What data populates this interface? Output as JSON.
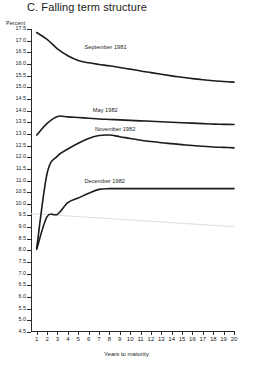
{
  "title": "C.  Falling term structure",
  "axis_unit_label": "Percent",
  "xlabel": "Years to maturity",
  "chart_data": {
    "type": "line",
    "title": "C.  Falling term structure",
    "xlabel": "Years to maturity",
    "ylabel": "Percent",
    "ylim": [
      4.5,
      17.5
    ],
    "xlim": [
      0.45,
      20
    ],
    "grid": false,
    "legend": "inline-annotations",
    "yticks": [
      "17.5",
      "17.0",
      "16.5",
      "16.0",
      "15.5",
      "15.0",
      "14.5",
      "14.0",
      "13.5",
      "13.0",
      "12.5",
      "12.0",
      "11.5",
      "11.0",
      "10.5",
      "10.0",
      "9.5",
      "9.0",
      "8.5",
      "8.0",
      "7.5",
      "7.0",
      "6.5",
      "6.0",
      "5.5",
      "5.0",
      "4.5"
    ],
    "ytick_values": [
      17.5,
      17.0,
      16.5,
      16.0,
      15.5,
      15.0,
      14.5,
      14.0,
      13.5,
      13.0,
      12.5,
      12.0,
      11.5,
      11.0,
      10.5,
      10.0,
      9.5,
      9.0,
      8.5,
      8.0,
      7.5,
      7.0,
      6.5,
      6.0,
      5.5,
      5.0,
      4.5
    ],
    "xticks": [
      "1",
      "2",
      "3",
      "4",
      "5",
      "6",
      "7",
      "8",
      "9",
      "10",
      "11",
      "12",
      "13",
      "14",
      "15",
      "16",
      "17",
      "18",
      "19",
      "20"
    ],
    "xtick_values": [
      1,
      2,
      3,
      4,
      5,
      6,
      7,
      8,
      9,
      10,
      11,
      12,
      13,
      14,
      15,
      16,
      17,
      18,
      19,
      20
    ],
    "x": [
      1,
      2,
      3,
      4,
      5,
      6,
      7,
      8,
      9,
      10,
      11,
      12,
      13,
      14,
      15,
      16,
      17,
      18,
      19,
      20
    ],
    "series": [
      {
        "name": "September 1981",
        "label": "September 1981",
        "color": "#1c1c1c",
        "values": [
          17.35,
          17.05,
          16.65,
          16.35,
          16.15,
          16.05,
          15.98,
          15.92,
          15.85,
          15.78,
          15.7,
          15.63,
          15.56,
          15.49,
          15.43,
          15.37,
          15.32,
          15.28,
          15.25,
          15.22
        ]
      },
      {
        "name": "May 1982",
        "label": "May 1982",
        "color": "#1c1c1c",
        "values": [
          12.95,
          13.45,
          13.75,
          13.73,
          13.7,
          13.67,
          13.64,
          13.62,
          13.6,
          13.58,
          13.56,
          13.54,
          13.52,
          13.5,
          13.48,
          13.46,
          13.44,
          13.42,
          13.41,
          13.4
        ]
      },
      {
        "name": "November 1982",
        "label": "November 1982",
        "color": "#1c1c1c",
        "values": [
          8.1,
          11.3,
          12.05,
          12.35,
          12.6,
          12.8,
          12.93,
          12.95,
          12.88,
          12.8,
          12.73,
          12.67,
          12.62,
          12.58,
          12.54,
          12.5,
          12.47,
          12.44,
          12.42,
          12.4
        ]
      },
      {
        "name": "December 1982",
        "label": "December 1982",
        "color": "#1c1c1c",
        "values": [
          8.05,
          9.45,
          9.55,
          10.05,
          10.25,
          10.45,
          10.62,
          10.65,
          10.65,
          10.65,
          10.65,
          10.65,
          10.65,
          10.65,
          10.65,
          10.65,
          10.65,
          10.65,
          10.65,
          10.65
        ]
      }
    ],
    "annotations": [
      {
        "text": "September 1981",
        "x": 5.6,
        "y": 16.7
      },
      {
        "text": "May 1982",
        "x": 6.4,
        "y": 14.0
      },
      {
        "text": "November 1982",
        "x": 6.6,
        "y": 13.15
      },
      {
        "text": "December 1982",
        "x": 5.6,
        "y": 10.95
      }
    ]
  }
}
